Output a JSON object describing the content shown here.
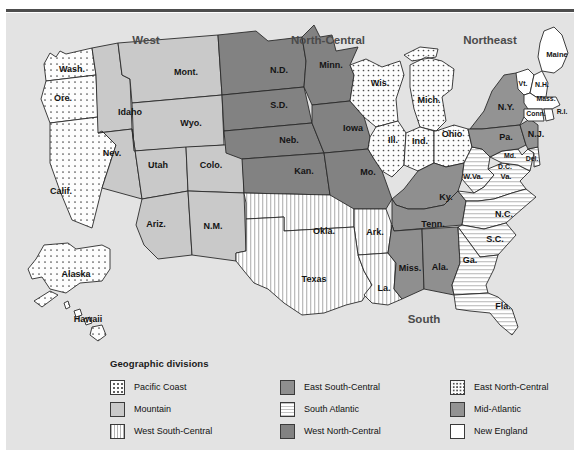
{
  "figure": {
    "caption": ""
  },
  "map": {
    "title": "Geographic divisions of the United States",
    "background_color": "#e3e3e3",
    "region_labels": [
      {
        "name": "West",
        "text": "West",
        "x": 140,
        "y": 31
      },
      {
        "name": "North-Central",
        "text": "North-Central",
        "x": 322,
        "y": 31
      },
      {
        "name": "Northeast",
        "text": "Northeast",
        "x": 484,
        "y": 31
      },
      {
        "name": "South",
        "text": "South",
        "x": 418,
        "y": 310
      }
    ],
    "states": [
      {
        "abbr": "Wash.",
        "division": "Pacific Coast",
        "x": 66,
        "y": 59
      },
      {
        "abbr": "Ore.",
        "division": "Pacific Coast",
        "x": 57,
        "y": 88
      },
      {
        "abbr": "Calif.",
        "division": "Pacific Coast",
        "x": 55,
        "y": 181
      },
      {
        "abbr": "Alaska",
        "division": "Pacific Coast",
        "x": 70,
        "y": 264
      },
      {
        "abbr": "Hawaii",
        "division": "Pacific Coast",
        "x": 82,
        "y": 309
      },
      {
        "abbr": "Idaho",
        "division": "Mountain",
        "x": 124,
        "y": 102
      },
      {
        "abbr": "Mont.",
        "division": "Mountain",
        "x": 180,
        "y": 62
      },
      {
        "abbr": "Wyo.",
        "division": "Mountain",
        "x": 185,
        "y": 113
      },
      {
        "abbr": "Nev.",
        "division": "Mountain",
        "x": 106,
        "y": 143
      },
      {
        "abbr": "Utah",
        "division": "Mountain",
        "x": 152,
        "y": 155
      },
      {
        "abbr": "Colo.",
        "division": "Mountain",
        "x": 205,
        "y": 155
      },
      {
        "abbr": "Ariz.",
        "division": "Mountain",
        "x": 150,
        "y": 214
      },
      {
        "abbr": "N.M.",
        "division": "Mountain",
        "x": 207,
        "y": 216
      },
      {
        "abbr": "N.D.",
        "division": "West North-Central",
        "x": 273,
        "y": 60
      },
      {
        "abbr": "S.D.",
        "division": "West North-Central",
        "x": 273,
        "y": 95
      },
      {
        "abbr": "Neb.",
        "division": "West North-Central",
        "x": 283,
        "y": 130
      },
      {
        "abbr": "Kan.",
        "division": "West North-Central",
        "x": 298,
        "y": 161
      },
      {
        "abbr": "Minn.",
        "division": "West North-Central",
        "x": 325,
        "y": 55
      },
      {
        "abbr": "Iowa",
        "division": "West North-Central",
        "x": 347,
        "y": 118
      },
      {
        "abbr": "Mo.",
        "division": "West North-Central",
        "x": 362,
        "y": 162
      },
      {
        "abbr": "Wis.",
        "division": "East North-Central",
        "x": 374,
        "y": 73
      },
      {
        "abbr": "Mich.",
        "division": "East North-Central",
        "x": 423,
        "y": 90
      },
      {
        "abbr": "Ill.",
        "division": "East North-Central",
        "x": 387,
        "y": 130
      },
      {
        "abbr": "Ind.",
        "division": "East North-Central",
        "x": 414,
        "y": 131
      },
      {
        "abbr": "Ohio",
        "division": "East North-Central",
        "x": 446,
        "y": 124
      },
      {
        "abbr": "Okla.",
        "division": "West South-Central",
        "x": 318,
        "y": 221
      },
      {
        "abbr": "Ark.",
        "division": "West South-Central",
        "x": 369,
        "y": 222
      },
      {
        "abbr": "Texas",
        "division": "West South-Central",
        "x": 308,
        "y": 269
      },
      {
        "abbr": "La.",
        "division": "West South-Central",
        "x": 378,
        "y": 278
      },
      {
        "abbr": "Ky.",
        "division": "East South-Central",
        "x": 440,
        "y": 187
      },
      {
        "abbr": "Tenn.",
        "division": "East South-Central",
        "x": 427,
        "y": 214
      },
      {
        "abbr": "Miss.",
        "division": "East South-Central",
        "x": 404,
        "y": 258
      },
      {
        "abbr": "Ala.",
        "division": "East South-Central",
        "x": 434,
        "y": 257
      },
      {
        "abbr": "W.Va.",
        "division": "South Atlantic",
        "x": 467,
        "y": 166
      },
      {
        "abbr": "Va.",
        "division": "South Atlantic",
        "x": 500,
        "y": 166
      },
      {
        "abbr": "Md.",
        "division": "South Atlantic",
        "x": 504,
        "y": 145
      },
      {
        "abbr": "D.C.",
        "division": "South Atlantic",
        "x": 499,
        "y": 156
      },
      {
        "abbr": "Del.",
        "division": "South Atlantic",
        "x": 526,
        "y": 148
      },
      {
        "abbr": "N.C.",
        "division": "South Atlantic",
        "x": 498,
        "y": 204
      },
      {
        "abbr": "S.C.",
        "division": "South Atlantic",
        "x": 489,
        "y": 229
      },
      {
        "abbr": "Ga.",
        "division": "South Atlantic",
        "x": 464,
        "y": 250
      },
      {
        "abbr": "Fla.",
        "division": "South Atlantic",
        "x": 497,
        "y": 296
      },
      {
        "abbr": "N.Y.",
        "division": "Mid-Atlantic",
        "x": 500,
        "y": 97
      },
      {
        "abbr": "Pa.",
        "division": "Mid-Atlantic",
        "x": 500,
        "y": 127
      },
      {
        "abbr": "N.J.",
        "division": "Mid-Atlantic",
        "x": 530,
        "y": 124
      },
      {
        "abbr": "Maine",
        "division": "New England",
        "x": 551,
        "y": 44
      },
      {
        "abbr": "Vt.",
        "division": "New England",
        "x": 517,
        "y": 73
      },
      {
        "abbr": "N.H.",
        "division": "New England",
        "x": 536,
        "y": 74
      },
      {
        "abbr": "Mass.",
        "division": "New England",
        "x": 540,
        "y": 88
      },
      {
        "abbr": "Conn.",
        "division": "New England",
        "x": 530,
        "y": 103
      },
      {
        "abbr": "R.I.",
        "division": "New England",
        "x": 556,
        "y": 101
      }
    ]
  },
  "legend": {
    "title": "Geographic divisions",
    "items": [
      {
        "label": "Pacific Coast",
        "pattern": "dots-sparse",
        "color": "#fdfdfd"
      },
      {
        "label": "East South-Central",
        "pattern": "solid",
        "color": "#8f8f8f"
      },
      {
        "label": "East North-Central",
        "pattern": "dots-dense",
        "color": "#fdfdfd"
      },
      {
        "label": "Mountain",
        "pattern": "solid",
        "color": "#c9c9c9"
      },
      {
        "label": "South Atlantic",
        "pattern": "h-stripes",
        "color": "#ffffff"
      },
      {
        "label": "Mid-Atlantic",
        "pattern": "solid",
        "color": "#939393"
      },
      {
        "label": "West South-Central",
        "pattern": "v-stripes",
        "color": "#ffffff"
      },
      {
        "label": "West North-Central",
        "pattern": "solid",
        "color": "#828282"
      },
      {
        "label": "New England",
        "pattern": "solid",
        "color": "#ffffff"
      }
    ]
  }
}
